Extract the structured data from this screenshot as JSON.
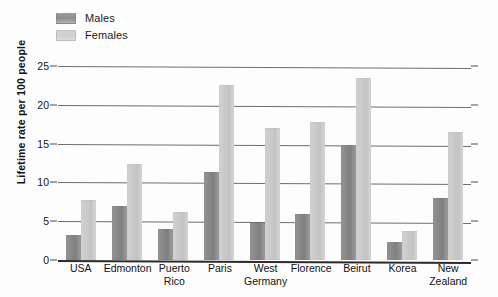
{
  "chart_data": {
    "type": "bar",
    "title": "",
    "subtitle": "",
    "xlabel": "",
    "ylabel": "Lifetime rate per 100 people",
    "ylim": [
      0,
      25
    ],
    "yticks": [
      0,
      5,
      10,
      15,
      20,
      25
    ],
    "ytick_labels": [
      "0",
      "5",
      "10",
      "15",
      "20",
      "25"
    ],
    "grid": true,
    "legend_position": "top-left",
    "categories": [
      "USA",
      "Edmonton",
      "Puerto Rico",
      "Paris",
      "West Germany",
      "Florence",
      "Beirut",
      "Korea",
      "New Zealand"
    ],
    "category_lines": [
      [
        "USA"
      ],
      [
        "Edmonton"
      ],
      [
        "Puerto",
        "Rico"
      ],
      [
        "Paris"
      ],
      [
        "West",
        "Germany"
      ],
      [
        "Florence"
      ],
      [
        "Beirut"
      ],
      [
        "Korea"
      ],
      [
        "New",
        "Zealand"
      ]
    ],
    "series": [
      {
        "name": "Males",
        "color": "#8a8a8a",
        "values": [
          3.2,
          6.9,
          4.0,
          11.3,
          4.8,
          5.9,
          14.8,
          2.3,
          8.0
        ]
      },
      {
        "name": "Females",
        "color": "#cccccc",
        "values": [
          7.7,
          12.4,
          6.2,
          22.5,
          17.0,
          17.8,
          23.5,
          3.8,
          16.5
        ]
      }
    ]
  },
  "legend": {
    "items": [
      {
        "label": "Males",
        "swatch": "males"
      },
      {
        "label": "Females",
        "swatch": "females"
      }
    ]
  }
}
